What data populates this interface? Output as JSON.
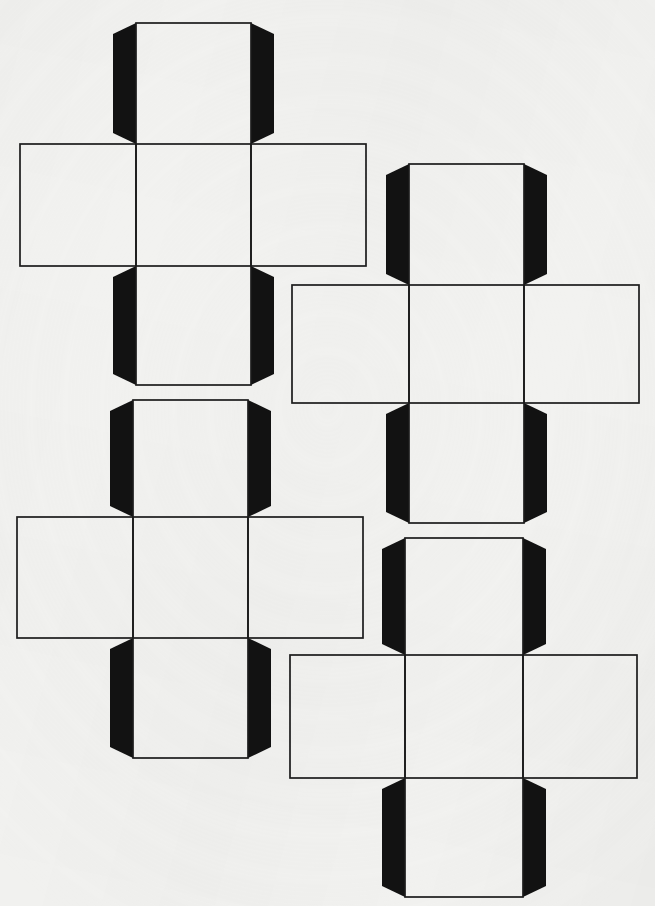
{
  "document": {
    "kind": "scanned-worksheet-page",
    "title": "Cube net templates",
    "page_width": 655,
    "page_height": 906,
    "background_color": "#f2f2f0",
    "ink_color": "#1c1c1c",
    "tab_fill_color": "#121212",
    "stroke_width": 1.7,
    "text_content": "",
    "net_count": 4
  },
  "nets": [
    {
      "id": "net-1",
      "label": "cube-net-top-left",
      "shape": "cross",
      "panel_count": 6,
      "tab_count": 4,
      "vertical_strip": {
        "x": 136,
        "width": 115,
        "top": 23,
        "bottom": 385
      },
      "horizontal_strip": {
        "y": 144,
        "height": 122,
        "left": 20,
        "right": 366
      },
      "panels": [
        {
          "name": "top-panel",
          "x": 136,
          "y": 23,
          "w": 115,
          "h": 121
        },
        {
          "name": "left-panel",
          "x": 20,
          "y": 144,
          "w": 116,
          "h": 122
        },
        {
          "name": "center-panel",
          "x": 136,
          "y": 144,
          "w": 115,
          "h": 122
        },
        {
          "name": "right-panel",
          "x": 251,
          "y": 144,
          "w": 115,
          "h": 122
        },
        {
          "name": "bottom-panel",
          "x": 136,
          "y": 266,
          "w": 115,
          "h": 119
        }
      ],
      "tabs": [
        {
          "name": "tab-top-left",
          "side": "left",
          "panel": "top-panel",
          "depth": 23
        },
        {
          "name": "tab-top-right",
          "side": "right",
          "panel": "top-panel",
          "depth": 23
        },
        {
          "name": "tab-bottom-left",
          "side": "left",
          "panel": "bottom-panel",
          "depth": 23
        },
        {
          "name": "tab-bottom-right",
          "side": "right",
          "panel": "bottom-panel",
          "depth": 23
        }
      ]
    },
    {
      "id": "net-2",
      "label": "cube-net-top-right",
      "shape": "cross",
      "panel_count": 6,
      "tab_count": 4,
      "vertical_strip": {
        "x": 409,
        "width": 115,
        "top": 164,
        "bottom": 523
      },
      "horizontal_strip": {
        "y": 285,
        "height": 118,
        "left": 292,
        "right": 639
      },
      "panels": [
        {
          "name": "top-panel",
          "x": 409,
          "y": 164,
          "w": 115,
          "h": 121
        },
        {
          "name": "left-panel",
          "x": 292,
          "y": 285,
          "w": 117,
          "h": 118
        },
        {
          "name": "center-panel",
          "x": 409,
          "y": 285,
          "w": 115,
          "h": 118
        },
        {
          "name": "right-panel",
          "x": 524,
          "y": 285,
          "w": 115,
          "h": 118
        },
        {
          "name": "bottom-panel",
          "x": 409,
          "y": 403,
          "w": 115,
          "h": 120
        }
      ],
      "tabs": [
        {
          "name": "tab-top-left",
          "side": "left",
          "panel": "top-panel",
          "depth": 23
        },
        {
          "name": "tab-top-right",
          "side": "right",
          "panel": "top-panel",
          "depth": 23
        },
        {
          "name": "tab-bottom-left",
          "side": "left",
          "panel": "bottom-panel",
          "depth": 23
        },
        {
          "name": "tab-bottom-right",
          "side": "right",
          "panel": "bottom-panel",
          "depth": 23
        }
      ]
    },
    {
      "id": "net-3",
      "label": "cube-net-bottom-left",
      "shape": "cross",
      "panel_count": 6,
      "tab_count": 4,
      "vertical_strip": {
        "x": 133,
        "width": 115,
        "top": 400,
        "bottom": 758
      },
      "horizontal_strip": {
        "y": 517,
        "height": 121,
        "left": 17,
        "right": 363
      },
      "panels": [
        {
          "name": "top-panel",
          "x": 133,
          "y": 400,
          "w": 115,
          "h": 117
        },
        {
          "name": "left-panel",
          "x": 17,
          "y": 517,
          "w": 116,
          "h": 121
        },
        {
          "name": "center-panel",
          "x": 133,
          "y": 517,
          "w": 115,
          "h": 121
        },
        {
          "name": "right-panel",
          "x": 248,
          "y": 517,
          "w": 115,
          "h": 121
        },
        {
          "name": "bottom-panel",
          "x": 133,
          "y": 638,
          "w": 115,
          "h": 120
        }
      ],
      "tabs": [
        {
          "name": "tab-top-left",
          "side": "left",
          "panel": "top-panel",
          "depth": 23
        },
        {
          "name": "tab-top-right",
          "side": "right",
          "panel": "top-panel",
          "depth": 23
        },
        {
          "name": "tab-bottom-left",
          "side": "left",
          "panel": "bottom-panel",
          "depth": 23
        },
        {
          "name": "tab-bottom-right",
          "side": "right",
          "panel": "bottom-panel",
          "depth": 23
        }
      ]
    },
    {
      "id": "net-4",
      "label": "cube-net-bottom-right",
      "shape": "cross",
      "panel_count": 6,
      "tab_count": 4,
      "vertical_strip": {
        "x": 405,
        "width": 118,
        "top": 538,
        "bottom": 897
      },
      "horizontal_strip": {
        "y": 655,
        "height": 123,
        "left": 290,
        "right": 637
      },
      "panels": [
        {
          "name": "top-panel",
          "x": 405,
          "y": 538,
          "w": 118,
          "h": 117
        },
        {
          "name": "left-panel",
          "x": 290,
          "y": 655,
          "w": 115,
          "h": 123
        },
        {
          "name": "center-panel",
          "x": 405,
          "y": 655,
          "w": 118,
          "h": 123
        },
        {
          "name": "right-panel",
          "x": 523,
          "y": 655,
          "w": 114,
          "h": 123
        },
        {
          "name": "bottom-panel",
          "x": 405,
          "y": 778,
          "w": 118,
          "h": 119
        }
      ],
      "tabs": [
        {
          "name": "tab-top-left",
          "side": "left",
          "panel": "top-panel",
          "depth": 23
        },
        {
          "name": "tab-top-right",
          "side": "right",
          "panel": "top-panel",
          "depth": 23
        },
        {
          "name": "tab-bottom-left",
          "side": "left",
          "panel": "bottom-panel",
          "depth": 23
        },
        {
          "name": "tab-bottom-right",
          "side": "right",
          "panel": "bottom-panel",
          "depth": 23
        }
      ]
    }
  ]
}
